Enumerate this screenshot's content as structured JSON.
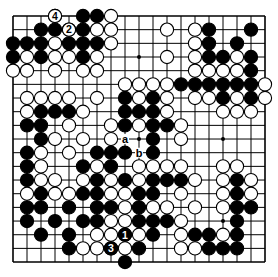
{
  "diagram": {
    "type": "go-board",
    "size": 19,
    "colors": {
      "black": "#000000",
      "white": "#ffffff",
      "line": "#000000",
      "background": "#ffffff"
    },
    "rows": [
      "...W.BBW...........",
      "..BBWBWW...W.WB..B.",
      "BBBWBBBW.....WB.B..",
      "BWBWWBW....W.WBBWB.",
      "WW.W.WW......WWWWB.",
      "........WWWWBBBBBBW",
      ".WWWW.W.BWBW.WWBWBW",
      ".WBBBW..BBBW...WWW.",
      ".BB.W..WBWBBW......",
      "..BW.W.W..B.W......",
      ".BW.W.BBB.B........",
      ".BW..BWB.WWWW..WW..",
      ".BWW.WBWBWBBBW.WBW.",
      ".WBWWBBWWBB.W..WBW.",
      ".BB.B.BBWBWW.W.WBB.",
      ".B.B.BBWWBBBW...B..",
      "..B.B.WWBWB.WBBWB..",
      "....BWWBWB..WWBBB..",
      "........B.........."
    ],
    "numbered_moves": [
      {
        "label": "1",
        "row": 16,
        "col": 8,
        "color": "black"
      },
      {
        "label": "2",
        "row": 1,
        "col": 4,
        "color": "white"
      },
      {
        "label": "3",
        "row": 17,
        "col": 7,
        "color": "black"
      },
      {
        "label": "4",
        "row": 0,
        "col": 3,
        "color": "white"
      }
    ],
    "letter_marks": [
      {
        "label": "a",
        "row": 9,
        "col": 8
      },
      {
        "label": "b",
        "row": 10,
        "col": 9
      }
    ],
    "star_points": [
      [
        3,
        3
      ],
      [
        3,
        9
      ],
      [
        3,
        15
      ],
      [
        9,
        3
      ],
      [
        9,
        9
      ],
      [
        9,
        15
      ],
      [
        15,
        3
      ],
      [
        15,
        9
      ],
      [
        15,
        15
      ]
    ]
  }
}
